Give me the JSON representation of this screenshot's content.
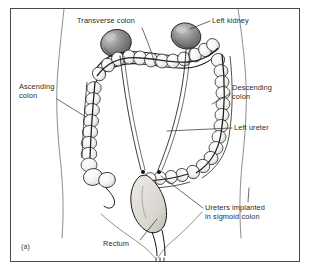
{
  "figure": {
    "panel_caption": "(a)",
    "style": "black-and-white-line-drawing",
    "colors": {
      "background": "#ffffff",
      "frame_border": "#4a4a4a",
      "ink": "#1a1a1a",
      "label_text": "#2b2b2b",
      "kidney_fill": "#8e8e8e",
      "kidney_shadow": "#5f5f5f",
      "kidney_highlight": "#cfcfcf",
      "colon_fill": "#f2f2f0",
      "rectum_fill": "#dedbd6",
      "body_outline": "#6f6f6f"
    }
  },
  "labels": {
    "transverse_colon": "Transverse colon",
    "left_kidney": "Left kidney",
    "ascending_colon": "Ascending\ncolon",
    "descending_colon": "Descending\ncolon",
    "left_ureter": "Left ureter",
    "ureters_implanted": "Ureters implanted\nin sigmoid colon",
    "rectum": "Rectum"
  },
  "structures": [
    {
      "name": "left-kidney",
      "label": "Left kidney"
    },
    {
      "name": "right-kidney",
      "label": ""
    },
    {
      "name": "transverse-colon",
      "label": "Transverse colon"
    },
    {
      "name": "ascending-colon",
      "label": "Ascending colon"
    },
    {
      "name": "descending-colon",
      "label": "Descending colon"
    },
    {
      "name": "left-ureter",
      "label": "Left ureter"
    },
    {
      "name": "right-ureter",
      "label": ""
    },
    {
      "name": "sigmoid-colon",
      "label": "Ureters implanted in sigmoid colon"
    },
    {
      "name": "rectum",
      "label": "Rectum"
    },
    {
      "name": "cecum",
      "label": ""
    },
    {
      "name": "appendix",
      "label": ""
    },
    {
      "name": "body-outline",
      "label": ""
    }
  ]
}
